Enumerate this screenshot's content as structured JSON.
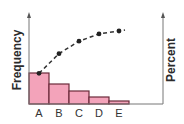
{
  "chart_data": {
    "type": "bar",
    "subtype": "pareto",
    "title": "",
    "xlabel": "",
    "ylabel": "Frequency",
    "ylabel_right": "Percent",
    "categories": [
      "A",
      "B",
      "C",
      "D",
      "E"
    ],
    "series": [
      {
        "name": "Frequency",
        "kind": "bar",
        "values": [
          31,
          20,
          13,
          7,
          3
        ]
      },
      {
        "name": "Cumulative Percent",
        "kind": "line",
        "style": "dashed",
        "markers": true,
        "values": [
          42,
          69,
          86,
          96,
          100
        ]
      }
    ],
    "ticks_shown": false,
    "grid": false,
    "legend": "none",
    "colors": {
      "bar_fill": "#f3a3ba",
      "bar_edge": "#6b2a3a",
      "line": "#333333",
      "axis": "#777777"
    }
  }
}
